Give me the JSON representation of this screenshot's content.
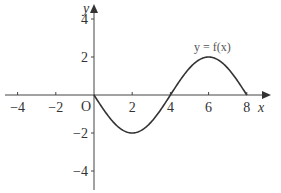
{
  "chart_data": {
    "type": "line",
    "title": "",
    "xlabel": "x",
    "ylabel": "y",
    "origin_label": "O",
    "curve_label": "y = f(x)",
    "xlim": [
      -5,
      8.6
    ],
    "ylim": [
      -5,
      4.8
    ],
    "x_ticks": [
      -4,
      -2,
      2,
      4,
      6,
      8
    ],
    "x_tick_labels": [
      "−4",
      "−2",
      "2",
      "4",
      "6",
      "8"
    ],
    "y_ticks": [
      4,
      2,
      -2,
      -4
    ],
    "y_tick_labels": [
      "4",
      "2",
      "−2",
      "−4"
    ],
    "grid": false,
    "series": [
      {
        "name": "y = f(x)",
        "x": [
          0,
          1,
          2,
          3,
          4,
          5,
          6,
          7,
          8
        ],
        "y": [
          0,
          -1.41,
          -2,
          -1.41,
          0,
          1.41,
          2,
          1.41,
          0
        ]
      }
    ]
  }
}
